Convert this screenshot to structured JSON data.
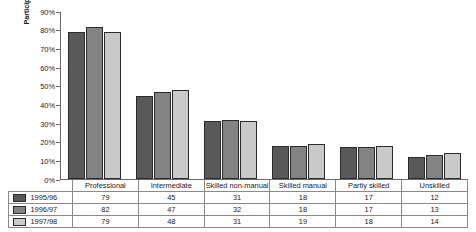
{
  "chart_data": {
    "type": "bar",
    "title": "",
    "subtitle": "",
    "xlabel": "",
    "ylabel": "Participation rates in higher education",
    "ylim": [
      0,
      90
    ],
    "ytick_labels": [
      "90%",
      "80%",
      "70%",
      "60%",
      "50%",
      "40%",
      "30%",
      "20%",
      "10%",
      "0%"
    ],
    "ytick_values": [
      90,
      80,
      70,
      60,
      50,
      40,
      30,
      20,
      10,
      0
    ],
    "grid": false,
    "legend_position": "table-left",
    "categories": [
      "Professional",
      "Intermediate",
      "Skilled non-manual",
      "Skilled manual",
      "Partly skilled",
      "Unskilled"
    ],
    "series": [
      {
        "name": "1995/96",
        "color": "#595959",
        "values": [
          79,
          45,
          31,
          18,
          17,
          12
        ]
      },
      {
        "name": "1996/97",
        "color": "#838383",
        "values": [
          82,
          47,
          32,
          18,
          17,
          13
        ]
      },
      {
        "name": "1997/98",
        "color": "#c9c9c9",
        "values": [
          79,
          48,
          31,
          19,
          18,
          14
        ]
      }
    ]
  },
  "colors": {
    "series_1995_96": "#595959",
    "series_1996_97": "#838383",
    "series_1997_98": "#c9c9c9",
    "axis": "#6b6b6b",
    "table_border": "#8a8a8a",
    "bar_outline": "#2b2b2b",
    "background": "#ffffff"
  }
}
